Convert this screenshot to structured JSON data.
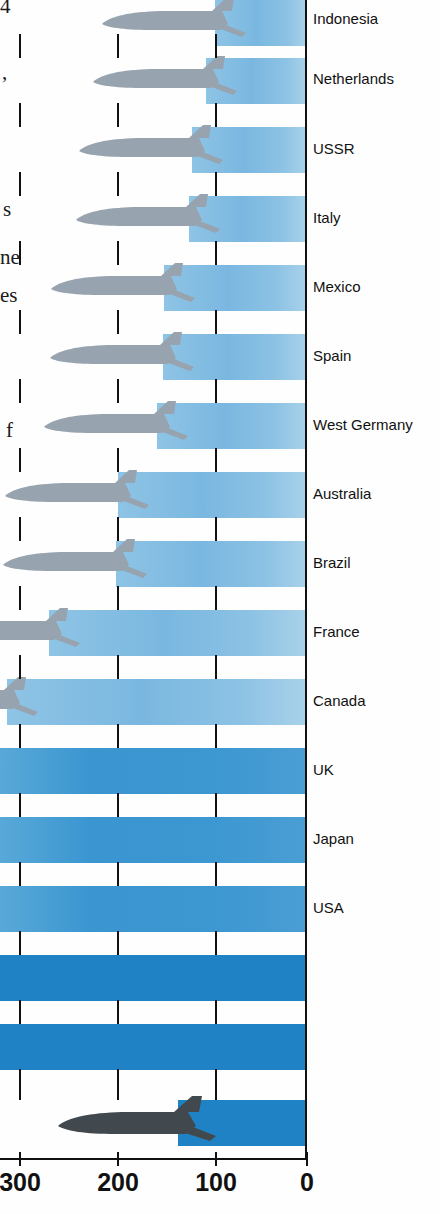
{
  "figure": {
    "title_fragments": [
      "4",
      ",",
      "s",
      "ne",
      "es",
      "f"
    ],
    "note": "horizontal bar chart with aircraft silhouettes, reversed x-axis"
  },
  "axis": {
    "ticks": [
      {
        "label": "300",
        "value": 300
      },
      {
        "label": "200",
        "value": 200
      },
      {
        "label": "100",
        "value": 100
      },
      {
        "label": "0",
        "value": 0
      }
    ],
    "reversed": true,
    "max": 322,
    "min": 0
  },
  "colors": {
    "bar_light": "#8cc2e4",
    "bar_mid": "#3d97d1",
    "bar_dark": "#1f82c4",
    "plane_light": "#93a0ab",
    "plane_dark": "#3f4850",
    "axis": "#111111",
    "background": "#ffffff"
  },
  "chart_data": {
    "type": "bar",
    "title": "",
    "xlabel": "",
    "ylabel": "",
    "orientation": "horizontal",
    "xlim": [
      322,
      0
    ],
    "grid": true,
    "legend": "none",
    "categories": [
      "Indonesia",
      "Netherlands",
      "USSR",
      "Italy",
      "Mexico",
      "Spain",
      "West Germany",
      "Australia",
      "Brazil",
      "France",
      "Canada",
      "UK",
      "Japan",
      "USA"
    ],
    "values": [
      95,
      103,
      118,
      121,
      147,
      148,
      155,
      196,
      198,
      268,
      312,
      322,
      322,
      322
    ],
    "tick_labels": [
      "300",
      "200",
      "100",
      "0"
    ]
  },
  "rows": [
    {
      "label": "Indonesia",
      "value": 95,
      "shade": "lt",
      "plane": "light",
      "bar_left": 215,
      "y": 0,
      "label_y": 10
    },
    {
      "label": "Netherlands",
      "value": 103,
      "shade": "lt",
      "plane": "light",
      "bar_left": 206,
      "y": 58,
      "label_y": 70
    },
    {
      "label": "USSR",
      "value": 118,
      "shade": "lt",
      "plane": "light",
      "bar_left": 192,
      "y": 127,
      "label_y": 140
    },
    {
      "label": "Italy",
      "value": 121,
      "shade": "lt",
      "plane": "light",
      "bar_left": 189,
      "y": 196,
      "label_y": 209
    },
    {
      "label": "Mexico",
      "value": 147,
      "shade": "lt",
      "plane": "light",
      "bar_left": 164,
      "y": 265,
      "label_y": 278
    },
    {
      "label": "Spain",
      "value": 148,
      "shade": "lt",
      "plane": "light",
      "bar_left": 163,
      "y": 334,
      "label_y": 347
    },
    {
      "label": "West Germany",
      "value": 155,
      "shade": "lt",
      "plane": "light",
      "bar_left": 157,
      "y": 403,
      "label_y": 416
    },
    {
      "label": "Australia",
      "value": 196,
      "shade": "lt",
      "plane": "light",
      "bar_left": 118,
      "y": 472,
      "label_y": 485
    },
    {
      "label": "Brazil",
      "value": 198,
      "shade": "lt",
      "plane": "light",
      "bar_left": 116,
      "y": 541,
      "label_y": 554
    },
    {
      "label": "France",
      "value": 268,
      "shade": "lt",
      "plane": "light",
      "bar_left": 49,
      "y": 610,
      "label_y": 623
    },
    {
      "label": "Canada",
      "value": 312,
      "shade": "lt",
      "plane": "light",
      "bar_left": 7,
      "y": 679,
      "label_y": 692
    },
    {
      "label": "UK",
      "value": 322,
      "shade": "md",
      "plane": "none",
      "bar_left": 0,
      "y": 748,
      "label_y": 761
    },
    {
      "label": "Japan",
      "value": 322,
      "shade": "md",
      "plane": "none",
      "bar_left": 0,
      "y": 817,
      "label_y": 830
    },
    {
      "label": "USA",
      "value": 322,
      "shade": "md",
      "plane": "none",
      "bar_left": 0,
      "y": 886,
      "label_y": 899
    },
    {
      "label": "",
      "value": 322,
      "shade": "solid",
      "plane": "none",
      "bar_left": 0,
      "y": 955,
      "label_y": 0
    },
    {
      "label": "",
      "value": 322,
      "shade": "solid",
      "plane": "none",
      "bar_left": 0,
      "y": 1024,
      "label_y": 0
    },
    {
      "label": "",
      "value": 180,
      "shade": "solid",
      "plane": "dark",
      "bar_left": 178,
      "y": 1100,
      "label_y": 0
    }
  ],
  "fragments": [
    {
      "text": "4",
      "x": 0,
      "y": -6
    },
    {
      "text": ",",
      "x": 2,
      "y": 60
    },
    {
      "text": "s",
      "x": 3,
      "y": 197
    },
    {
      "text": "ne",
      "x": 0,
      "y": 245
    },
    {
      "text": "es",
      "x": 0,
      "y": 283
    },
    {
      "text": "f",
      "x": 6,
      "y": 418
    }
  ],
  "ticks_x": [
    19,
    117,
    215,
    306
  ],
  "gutter_ticks": [
    {
      "y": 34,
      "h": 24
    },
    {
      "y": 103,
      "h": 24
    },
    {
      "y": 172,
      "h": 24
    },
    {
      "y": 241,
      "h": 24
    },
    {
      "y": 310,
      "h": 24
    },
    {
      "y": 379,
      "h": 24
    },
    {
      "y": 448,
      "h": 24
    },
    {
      "y": 517,
      "h": 24
    },
    {
      "y": 586,
      "h": 24
    },
    {
      "y": 655,
      "h": 24
    },
    {
      "y": 724,
      "h": 24
    },
    {
      "y": 793,
      "h": 24
    },
    {
      "y": 862,
      "h": 24
    },
    {
      "y": 931,
      "h": 24
    },
    {
      "y": 1000,
      "h": 24
    },
    {
      "y": 1069,
      "h": 31
    }
  ]
}
